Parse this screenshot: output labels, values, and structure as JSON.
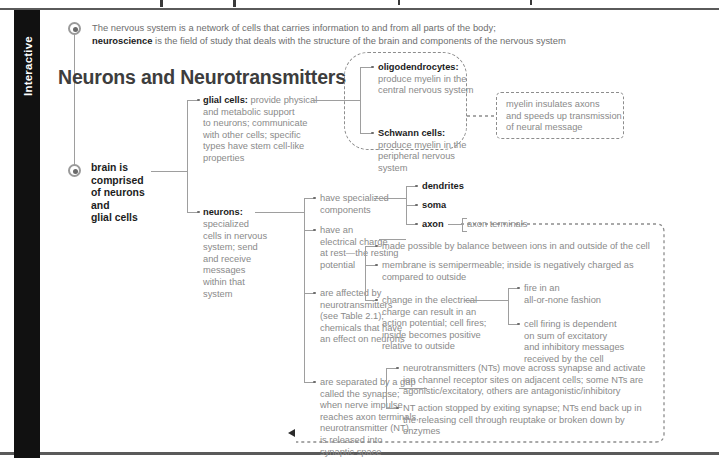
{
  "tab": {
    "label": "Interactive"
  },
  "header": {
    "title": "Neurons and Neurotransmitters"
  },
  "lead": {
    "line1_plain": "The nervous system is a network of cells that carries information to and from all parts of the body;",
    "line2_bold": "neuroscience",
    "line2_plain": " is the field of study that deals with the structure of the brain and components of the nervous system"
  },
  "root": {
    "label": "brain is\ncomprised\nof neurons\nand\nglial cells"
  },
  "branches": {
    "glial": {
      "bold": "glial cells:",
      "text": " provide physical\nand metabolic support\nto neurons; communicate\nwith other cells; specific\ntypes have stem cell-like\nproperties"
    },
    "neurons": {
      "bold": "neurons:",
      "text": "specialized\ncells in nervous\nsystem; send\nand receive\nmessages\nwithin that\nsystem"
    }
  },
  "glial_children": [
    {
      "bold": "oligodendrocytes:",
      "text": "produce myelin in the\ncentral nervous system"
    },
    {
      "bold": "Schwann cells:",
      "text": "produce myelin in the\nperipheral nervous system"
    }
  ],
  "myelin_note": {
    "text": "myelin insulates axons\nand speeds up transmission\nof neural message"
  },
  "neuron_children": [
    {
      "id": "components",
      "text": "have specialized\ncomponents"
    },
    {
      "id": "charge",
      "text": "have an\nelectrical charge\nat rest—the resting\npotential"
    },
    {
      "id": "neurotransmitters",
      "text": "are affected by\nneurotransmitters\n(see Table 2.1);\nchemicals that have\nan effect on neurons"
    },
    {
      "id": "synapse",
      "text": "are separated by a gap\ncalled the synapse;\nwhen nerve impulse\nreaches axon terminals,\nneurotransmitter (NT)\nis released into\nsynaptic space"
    }
  ],
  "components_children": [
    {
      "label": "dendrites"
    },
    {
      "label": "soma"
    },
    {
      "label": "axon"
    }
  ],
  "axon_terminals": {
    "label": "axon terminals"
  },
  "charge_children": [
    {
      "text": "made possible by balance between ions in and outside of the cell"
    },
    {
      "text": "membrane is semipermeable; inside is negatively charged as\ncompared to outside"
    },
    {
      "text": "change in the electrical\ncharge can result in an\naction potential; cell fires;\ninside becomes positive\nrelative to outside"
    }
  ],
  "action_potential_children": [
    {
      "text": "fire in an\nall-or-none fashion"
    },
    {
      "text": "cell firing is dependent\non sum of excitatory\nand inhibitory messages\nreceived by the cell"
    }
  ],
  "synapse_children": [
    {
      "text": "neurotransmitters (NTs) move across synapse and activate\nion channel receptor sites on adjacent cells; some NTs are\nagonistic/excitatory, others are antagonistic/inhibitory"
    },
    {
      "text": "NT action stopped by exiting synapse; NTs end back up in\nthe releasing cell through reuptake or broken down by\nenzymes"
    }
  ],
  "colors": {
    "tab_bg": "#111111",
    "rule": "#5a5a5a",
    "body_text": "#8a8a8a",
    "bold_text": "#1c1c1c",
    "header_text": "#3d3d3d",
    "line": "#9e9e9e",
    "dashed": "#8d8d8d",
    "arrow": "#2b2b2b"
  }
}
